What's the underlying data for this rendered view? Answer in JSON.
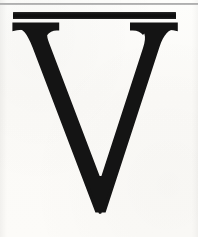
{
  "page": {
    "width": 198,
    "height": 237,
    "background_color": "#fbfaf7"
  },
  "ink": {
    "color": "#141414",
    "rule_color": "#0d0d0d",
    "hairline_color": "#9a9a9a"
  },
  "top_rule": {
    "name": "hairline-rule",
    "color": "#9a9a9a",
    "y": 3,
    "thickness": 2,
    "width": 198
  },
  "heavy_rule": {
    "name": "heavy-black-bar",
    "color": "#0d0d0d",
    "x": 13,
    "y": 12,
    "width": 163,
    "thickness": 7
  },
  "initial": {
    "character": "V",
    "style": "serif-capital",
    "left_serif_x": 12,
    "right_serif_x": 178,
    "cap_top_y": 22,
    "vertex_x": 97,
    "vertex_y": 212,
    "thick_stroke_width": 22,
    "thin_stroke_width": 14
  },
  "alt_text": "Large black serif capital letter V beneath a thick horizontal rule"
}
